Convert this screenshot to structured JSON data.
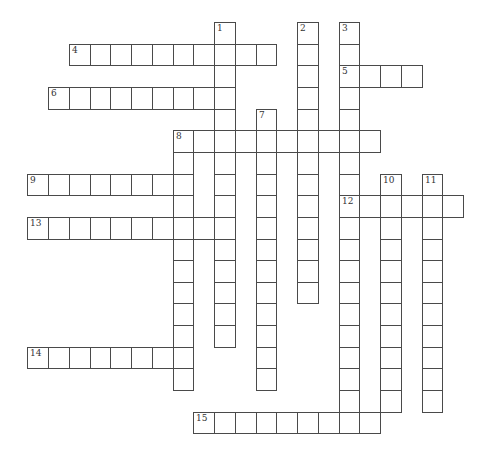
{
  "puzzle": {
    "type": "crossword",
    "grid": {
      "origin_x": 27.3,
      "origin_y": 22,
      "cell_w": 20.75,
      "cell_h": 21.65,
      "line_color": "#4a4a4a",
      "number_color": "#333333",
      "background": "#ffffff"
    },
    "entries": [
      {
        "number": "1",
        "direction": "down",
        "row": 0,
        "col": 9,
        "length": 15
      },
      {
        "number": "2",
        "direction": "down",
        "row": 0,
        "col": 13,
        "length": 13
      },
      {
        "number": "3",
        "direction": "down",
        "row": 0,
        "col": 15,
        "length": 19
      },
      {
        "number": "4",
        "direction": "across",
        "row": 1,
        "col": 2,
        "length": 10
      },
      {
        "number": "5",
        "direction": "across",
        "row": 2,
        "col": 15,
        "length": 4
      },
      {
        "number": "6",
        "direction": "across",
        "row": 3,
        "col": 1,
        "length": 9
      },
      {
        "number": "7",
        "direction": "down",
        "row": 4,
        "col": 11,
        "length": 13
      },
      {
        "number": "8",
        "direction": "across",
        "row": 5,
        "col": 7,
        "length": 10
      },
      {
        "number": "8",
        "direction": "down",
        "row": 5,
        "col": 7,
        "length": 12
      },
      {
        "number": "9",
        "direction": "across",
        "row": 7,
        "col": 0,
        "length": 8
      },
      {
        "number": "10",
        "direction": "down",
        "row": 7,
        "col": 17,
        "length": 11
      },
      {
        "number": "11",
        "direction": "down",
        "row": 7,
        "col": 19,
        "length": 11
      },
      {
        "number": "12",
        "direction": "across",
        "row": 8,
        "col": 15,
        "length": 6
      },
      {
        "number": "13",
        "direction": "across",
        "row": 9,
        "col": 0,
        "length": 10
      },
      {
        "number": "14",
        "direction": "across",
        "row": 15,
        "col": 0,
        "length": 8
      },
      {
        "number": "15",
        "direction": "across",
        "row": 18,
        "col": 8,
        "length": 9
      }
    ]
  }
}
